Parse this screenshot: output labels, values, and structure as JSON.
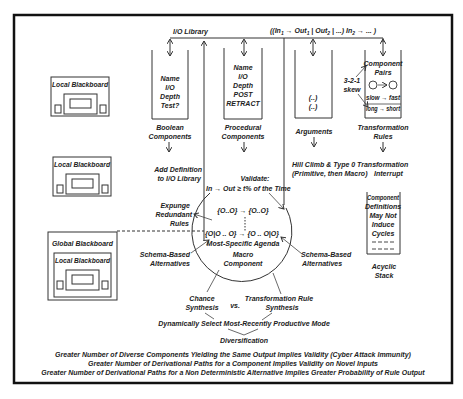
{
  "io_library": {
    "label": "I/O Library",
    "formula": "((In",
    "formula_parts": [
      "((In",
      "1",
      " → Out",
      "1",
      " | Out",
      "2",
      " | ...) In",
      "2",
      " → ... )"
    ]
  },
  "blackboards": {
    "local_1": "Local Blackboard",
    "local_2": "Local Blackboard",
    "global": "Global Blackboard",
    "global_inner_local": "Local Blackboard"
  },
  "columns": {
    "boolean": {
      "lines": [
        "Name",
        "I/O",
        "Depth",
        "Test?"
      ],
      "label": [
        "Boolean",
        "Components"
      ]
    },
    "procedural": {
      "lines": [
        "Name",
        "I/O",
        "Depth",
        "POST",
        "RETRACT"
      ],
      "label": [
        "Procedural",
        "Components"
      ]
    },
    "arguments": {
      "lines": [
        "(..)",
        "(..)"
      ],
      "label": [
        "Arguments"
      ]
    },
    "transformation": {
      "lines": [
        "Component",
        "Pairs",
        "slow → fast",
        "long → short"
      ],
      "side_label": [
        "3-2-1",
        "skew"
      ],
      "label": [
        "Transformation",
        "Rules"
      ]
    }
  },
  "middle": {
    "add_definition": [
      "Add Definition",
      "to I/O Library"
    ],
    "validate": [
      "Validate:",
      "In → Out ≥ t% of the Time"
    ],
    "hill_climb": [
      "Hill Climb & Type 0 Transformation",
      "(Primitive, then Macro)",
      "Interrupt"
    ],
    "expunge": [
      "Expunge",
      "Redundant",
      "Rules"
    ]
  },
  "circle": {
    "row1": "{O..O} → {O..O}",
    "row2": "{O|O .. O} → {O .. O|O}",
    "agenda": "Most-Specific Agenda",
    "macro": [
      "Macro",
      "Component"
    ]
  },
  "schema_left": [
    "Schema-Based",
    "Alternatives"
  ],
  "schema_right": [
    "Schema-Based",
    "Alternatives"
  ],
  "acyclic_stack": {
    "lines": [
      "Component",
      "Definitions",
      "May Not",
      "Induce",
      "Cycles",
      "- - - -",
      "- - - -"
    ],
    "label": [
      "Acyclic",
      "Stack"
    ]
  },
  "synthesis": {
    "chance": [
      "Chance",
      "Synthesis"
    ],
    "vs": "vs.",
    "transformation": [
      "Transformation Rule",
      "Synthesis"
    ],
    "dynamic": "Dynamically Select Most-Recently Productive Mode",
    "diversification": "Diversification"
  },
  "footer": [
    "Greater Number of Diverse Components Yielding the Same Output Implies Validity (Cyber Attack Immunity)",
    "Greater Number of Derivational Paths for a Component Implies Validity on Novel Inputs",
    "Greater Number of Derivational Paths for a Non Deterministic Alternative Implies Greater Probability of Rule Output"
  ]
}
